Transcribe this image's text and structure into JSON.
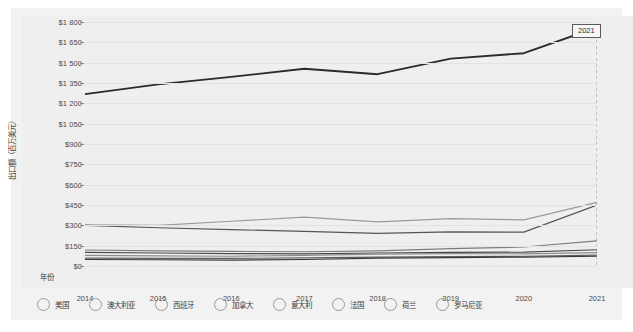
{
  "chart_data": {
    "type": "line",
    "title": "",
    "subtitle": "",
    "xlabel": "年份",
    "ylabel": "出口额（百万美元）",
    "x": [
      2014,
      2015,
      2016,
      2017,
      2018,
      2019,
      2020,
      2021
    ],
    "x_tick_labels": [
      "2014",
      "2015",
      "2016",
      "2017",
      "2018",
      "2019",
      "2020",
      "2021"
    ],
    "y_tick_labels": [
      "$1 800",
      "$1 650",
      "$1 500",
      "$1 350",
      "$1 200",
      "$1 050",
      "$900",
      "$750",
      "$600",
      "$450",
      "$300",
      "$150",
      "$0"
    ],
    "y_tick_values": [
      1800,
      1650,
      1500,
      1350,
      1200,
      1050,
      900,
      750,
      600,
      450,
      300,
      150,
      0
    ],
    "ylim": [
      0,
      1800
    ],
    "xlim": [
      2014,
      2021
    ],
    "grid": true,
    "legend_position": "bottom",
    "annotation": {
      "label": "2021",
      "x": 2021,
      "dashed_guide": true
    },
    "series": [
      {
        "name": "美国",
        "color": "#2b2b2b",
        "values": [
          1268,
          1340,
          1395,
          1455,
          1415,
          1530,
          1570,
          1760
        ]
      },
      {
        "name": "澳大利亚",
        "color": "#9a9a9a",
        "values": [
          303,
          300,
          330,
          360,
          325,
          350,
          340,
          470
        ]
      },
      {
        "name": "西班牙",
        "color": "#555555",
        "values": [
          300,
          282,
          268,
          255,
          240,
          252,
          250,
          450
        ]
      },
      {
        "name": "加拿大",
        "color": "#7d7d7d",
        "values": [
          118,
          112,
          108,
          105,
          112,
          128,
          140,
          185
        ]
      },
      {
        "name": "意大利",
        "color": "#4a4a4a",
        "values": [
          100,
          96,
          92,
          90,
          96,
          100,
          102,
          120
        ]
      },
      {
        "name": "法国",
        "color": "#8c8c8c",
        "values": [
          78,
          74,
          72,
          78,
          88,
          92,
          90,
          98
        ]
      },
      {
        "name": "荷兰",
        "color": "#606060",
        "values": [
          58,
          56,
          56,
          60,
          66,
          70,
          72,
          80
        ]
      },
      {
        "name": "罗马尼亚",
        "color": "#3a3a3a",
        "values": [
          48,
          46,
          44,
          48,
          58,
          62,
          66,
          72
        ]
      }
    ]
  },
  "legend": {
    "items": [
      {
        "label": "美国"
      },
      {
        "label": "澳大利亚"
      },
      {
        "label": "西班牙"
      },
      {
        "label": "加拿大"
      },
      {
        "label": "意大利"
      },
      {
        "label": "法国"
      },
      {
        "label": "荷兰"
      },
      {
        "label": "罗马尼亚"
      }
    ]
  }
}
